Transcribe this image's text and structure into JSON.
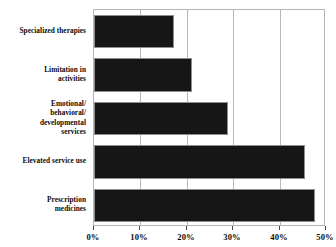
{
  "chart_data": {
    "type": "bar",
    "orientation": "horizontal",
    "title": "",
    "xlabel": "",
    "ylabel": "",
    "categories": [
      "Specialized therapies",
      "Limitation in activities",
      "Emotional/ behavioral/ developmental services",
      "Elevated service use",
      "Prescription medicines"
    ],
    "category_lines": [
      [
        "Specialized therapies"
      ],
      [
        "Limitation in",
        "activities"
      ],
      [
        "Emotional/",
        "behavioral/",
        "developmental",
        "services"
      ],
      [
        "Elevated service use"
      ],
      [
        "Prescription",
        "medicines"
      ]
    ],
    "values": [
      17.2,
      21.1,
      28.9,
      45.5,
      47.6
    ],
    "xlim": [
      0,
      50
    ],
    "xticks": [
      0,
      10,
      20,
      30,
      40,
      50
    ],
    "xtick_labels": [
      "0%",
      "10%",
      "20%",
      "30%",
      "40%",
      "50%"
    ],
    "gridlines": [
      10,
      20,
      30,
      40
    ],
    "grid": true,
    "legend": false,
    "bar_color": "#161616",
    "bar_edge_color": "#8e8e8e",
    "grid_color": "#b9b9b9",
    "frame_color": "#b5b5b5",
    "background_color": "#ffffff"
  }
}
